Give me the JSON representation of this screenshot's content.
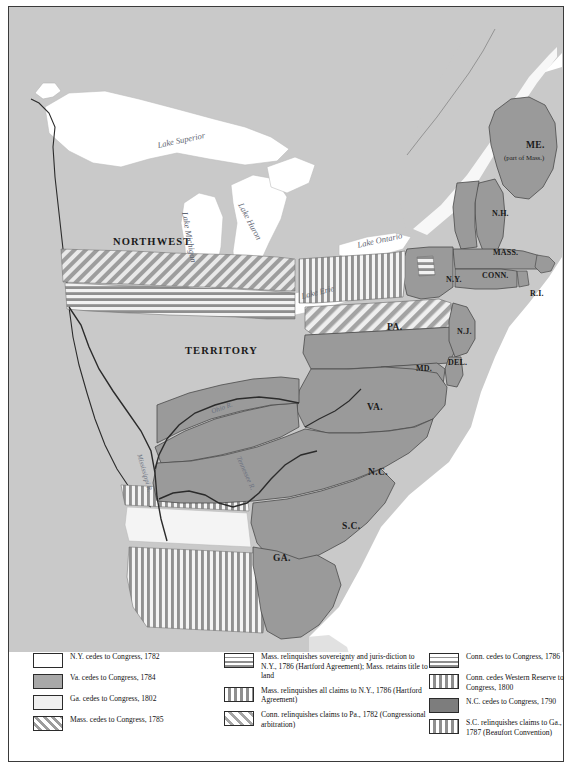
{
  "map": {
    "territory_labels": [
      {
        "name": "northwest",
        "text": "NORTHWEST",
        "x": 108,
        "y": 231,
        "cls": "lbl-terr"
      },
      {
        "name": "territory",
        "text": "TERRITORY",
        "x": 180,
        "y": 340,
        "cls": "lbl-terr"
      }
    ],
    "state_labels": [
      {
        "name": "maine",
        "text": "ME.",
        "x": 521,
        "y": 138,
        "cls": "lbl-state"
      },
      {
        "name": "maine-sub",
        "text": "(part of Mass.)",
        "x": 499,
        "y": 150,
        "cls": "lbl-sub"
      },
      {
        "name": "new-hampshire",
        "text": "N.H.",
        "x": 487,
        "y": 205,
        "cls": "lbl-state-sm"
      },
      {
        "name": "massachusetts",
        "text": "MASS.",
        "x": 489,
        "y": 245,
        "cls": "lbl-state-sm"
      },
      {
        "name": "connecticut",
        "text": "CONN.",
        "x": 478,
        "y": 268,
        "cls": "lbl-state-sm"
      },
      {
        "name": "rhode-island",
        "text": "R.I.",
        "x": 525,
        "y": 285,
        "cls": "lbl-state-sm"
      },
      {
        "name": "new-york",
        "text": "N.Y.",
        "x": 441,
        "y": 271,
        "cls": "lbl-state-sm"
      },
      {
        "name": "pennsylvania",
        "text": "PA.",
        "x": 382,
        "y": 320,
        "cls": "lbl-state"
      },
      {
        "name": "new-jersey",
        "text": "N.J.",
        "x": 452,
        "y": 323,
        "cls": "lbl-state-sm"
      },
      {
        "name": "delaware",
        "text": "DEL.",
        "x": 443,
        "y": 355,
        "cls": "lbl-state-sm"
      },
      {
        "name": "maryland",
        "text": "MD.",
        "x": 411,
        "y": 360,
        "cls": "lbl-state-sm"
      },
      {
        "name": "virginia",
        "text": "VA.",
        "x": 362,
        "y": 400,
        "cls": "lbl-state"
      },
      {
        "name": "north-carolina",
        "text": "N.C.",
        "x": 363,
        "y": 465,
        "cls": "lbl-state"
      },
      {
        "name": "south-carolina",
        "text": "S.C.",
        "x": 337,
        "y": 519,
        "cls": "lbl-state"
      },
      {
        "name": "georgia",
        "text": "GA.",
        "x": 268,
        "y": 551,
        "cls": "lbl-state"
      }
    ],
    "lake_labels": [
      {
        "name": "lake-superior",
        "text": "Lake Superior",
        "x": 152,
        "y": 132,
        "rot": -12
      },
      {
        "name": "lake-michigan",
        "text": "Lake Michigan",
        "x": 185,
        "y": 208,
        "rot": 80
      },
      {
        "name": "lake-huron",
        "text": "Lake Huron",
        "x": 240,
        "y": 198,
        "rot": 62
      },
      {
        "name": "lake-erie",
        "text": "Lake Erie",
        "x": 296,
        "y": 284,
        "rot": -14
      },
      {
        "name": "lake-ontario",
        "text": "Lake Ontario",
        "x": 352,
        "y": 232,
        "rot": -12
      }
    ],
    "river_labels": [
      {
        "name": "ohio-river",
        "text": "Ohio R.",
        "x": 206,
        "y": 401,
        "rot": -20
      },
      {
        "name": "mississippi-river",
        "text": "Mississippi R.",
        "x": 138,
        "y": 450,
        "rot": 74
      },
      {
        "name": "tennessee-river",
        "text": "Tennessee R.",
        "x": 237,
        "y": 452,
        "rot": 66
      }
    ]
  },
  "legend": {
    "columns": [
      {
        "name": "legend-column-1",
        "items": [
          {
            "pattern": "sw-white",
            "text": "N.Y. cedes to Congress, 1782"
          },
          {
            "pattern": "sw-gray",
            "text": "Va. cedes to Congress, 1784"
          },
          {
            "pattern": "sw-lightgray",
            "text": "Ga. cedes to Congress, 1802"
          },
          {
            "pattern": "sw-diag",
            "text": "Mass. cedes to Congress, 1785"
          }
        ]
      },
      {
        "name": "legend-column-2",
        "items": [
          {
            "pattern": "sw-horiz",
            "text": "Mass. relinquishes sovereignty and juris-diction to N.Y., 1786 (Hartford Agreement); Mass. retains title to land"
          },
          {
            "pattern": "sw-vert",
            "text": "Mass. relinquishes all claims to N.Y., 1786 (Hartford Agreement)"
          },
          {
            "pattern": "sw-diag2",
            "text": "Conn. relinquishes claims to Pa., 1782 (Congressional arbitration)"
          }
        ]
      },
      {
        "name": "legend-column-3",
        "items": [
          {
            "pattern": "sw-horiz",
            "text": "Conn. cedes to Congress, 1786"
          },
          {
            "pattern": "sw-vert",
            "text": "Conn. cedes Western Reserve to Congress, 1800"
          },
          {
            "pattern": "sw-darkgray",
            "text": "N.C. cedes to Congress, 1790"
          },
          {
            "pattern": "sw-vert",
            "text": "S.C. relinquishes claims to Ga., 1787 (Beaufort Convention)"
          }
        ]
      }
    ]
  },
  "colors": {
    "background": "#c9c9c9",
    "state_fill": "#9a9a9a",
    "water": "#ffffff",
    "border": "#3a3a3a"
  }
}
